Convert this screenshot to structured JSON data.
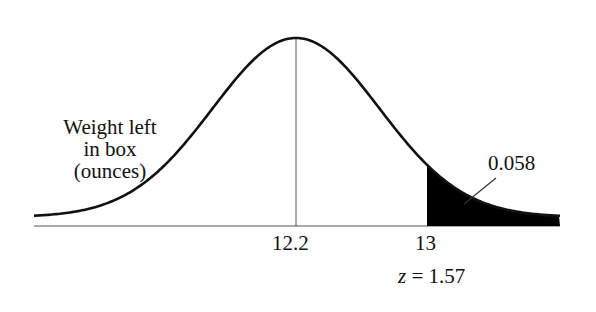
{
  "chart_data": {
    "type": "area",
    "title": "",
    "distribution": "normal",
    "mean": 12.2,
    "z_value": 1.57,
    "cutoff": 13,
    "shaded_tail_area": 0.058,
    "xlabel": "",
    "ylabel": "",
    "tick_labels": [
      "12.2",
      "13"
    ],
    "annotations": [
      "Weight left in box (ounces)",
      "0.058",
      "z = 1.57"
    ],
    "grid": false,
    "legend": "none"
  },
  "labels": {
    "variable_line1": "Weight left",
    "variable_line2": "in box",
    "variable_line3": "(ounces)",
    "area": "0.058",
    "mean_tick": "12.2",
    "cutoff_tick": "13",
    "z_label_var": "z",
    "z_label_rest": " = 1.57"
  },
  "colors": {
    "curve": "#111111",
    "shade": "#000000",
    "axis": "#444444"
  }
}
